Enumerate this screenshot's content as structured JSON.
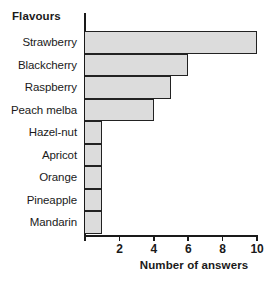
{
  "chart_data": {
    "type": "bar",
    "orientation": "horizontal",
    "title": "",
    "xlabel": "Number of answers",
    "ylabel": "Flavours",
    "categories": [
      "Strawberry",
      "Blackcherry",
      "Raspberry",
      "Peach melba",
      "Hazel-nut",
      "Apricot",
      "Orange",
      "Pineapple",
      "Mandarin"
    ],
    "values": [
      10,
      6,
      5,
      4,
      1,
      1,
      1,
      1,
      1
    ],
    "xlim": [
      0,
      10
    ],
    "xticks": [
      2,
      4,
      6,
      8,
      10
    ],
    "xtick_labels": [
      "2",
      "4",
      "6",
      "8",
      "10"
    ],
    "grid": false,
    "legend": false,
    "bar_fill_color": "#dcdcdc",
    "bar_border_color": "#222222",
    "axis_color": "#1a1a1a",
    "background_color": "#ffffff"
  }
}
